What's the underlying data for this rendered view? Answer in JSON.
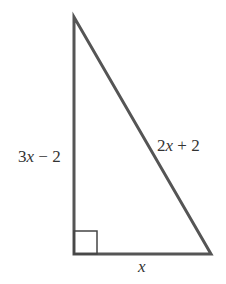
{
  "diagram": {
    "type": "right-triangle",
    "stroke_color": "#555555",
    "labels": {
      "left_side": {
        "coef": "3",
        "var": "x",
        "rest": " − 2"
      },
      "hypotenuse": {
        "coef": "2",
        "var": "x",
        "rest": " + 2"
      },
      "base": {
        "var": "x"
      }
    },
    "right_angle_marker": true
  }
}
